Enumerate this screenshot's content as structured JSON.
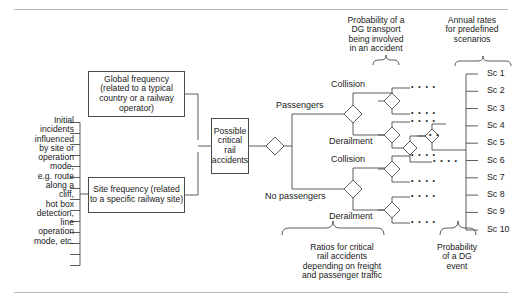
{
  "diagram": {
    "type": "event-tree",
    "stroke_color": "#4b4b4b",
    "rule_color": "#b9b9b9",
    "text_color": "#1a1a1a",
    "background": "#ffffff"
  },
  "left_block": {
    "text": "Initial\nincidents\ninfluenced\nby site or\noperation\nmode,\ne.g. route\nalong a\ncliff,\nhot box\ndetection,\nline\noperation\nmode, etc."
  },
  "boxes": {
    "global_frequency": "Global frequency\n(related to a typical\ncountry or a\nrailway operator)",
    "site_frequency": "Site frequency\n(related to a specific\nrailway site)",
    "possible_critical": "Possible\ncritical\nrail\naccidents"
  },
  "branch_labels": {
    "passengers": "Passengers",
    "no_passengers": "No passengers",
    "collision_upper": "Collision",
    "derailment_upper": "Derailment",
    "collision_lower": "Collision",
    "derailment_lower": "Derailment"
  },
  "column_headers": {
    "probability_dg_transport": "Probability of a\nDG transport\nbeing involved\nin an accident",
    "annual_rates": "Annual rates\nfor predefined\nscenarios"
  },
  "bottom_captions": {
    "ratios": "Ratios for critical\nrail accidents\ndepending on freight\nand passenger traffic",
    "dg_event": "Probability\nof a DG\nevent"
  },
  "scenarios": [
    {
      "label": "Sc 1"
    },
    {
      "label": "Sc 2"
    },
    {
      "label": "Sc 3"
    },
    {
      "label": "Sc 4"
    },
    {
      "label": "Sc 5"
    },
    {
      "label": "Sc 6"
    },
    {
      "label": "Sc 7"
    },
    {
      "label": "Sc 8"
    },
    {
      "label": "Sc 9"
    },
    {
      "label": "Sc 10"
    }
  ],
  "continuation_marks": {
    "glyph": "• • • •",
    "short_glyph": "• •",
    "meaning": "further-branches-ellipsis"
  }
}
